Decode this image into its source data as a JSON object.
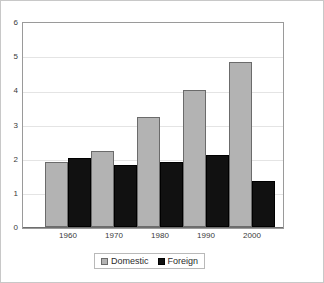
{
  "chart_data": {
    "type": "bar",
    "title": "",
    "subtitle": "",
    "xlabel": "",
    "ylabel": "",
    "categories": [
      "1960",
      "1970",
      "1980",
      "1990",
      "2000"
    ],
    "series": [
      {
        "name": "Domestic",
        "color": "#b3b3b3",
        "values": [
          1.9,
          2.2,
          3.2,
          4.0,
          4.8
        ]
      },
      {
        "name": "Foreign",
        "color": "#111111",
        "values": [
          2.0,
          1.8,
          1.9,
          2.1,
          1.35
        ]
      }
    ],
    "ylim": [
      0,
      6
    ],
    "yticks": [
      "0",
      "1",
      "2",
      "3",
      "4",
      "5",
      "6"
    ],
    "grid": true,
    "legend_position": "bottom",
    "annotations": []
  },
  "legend": {
    "entries": [
      {
        "label": "Domestic",
        "swatch": "gray-square-icon"
      },
      {
        "label": "Foreign",
        "swatch": "black-square-icon"
      }
    ]
  }
}
